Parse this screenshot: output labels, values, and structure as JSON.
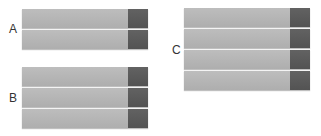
{
  "colors": {
    "light": "#b4b4b4",
    "dark": "#5a5a5a",
    "label": "#333333"
  },
  "groups": [
    {
      "label": "A",
      "bar_count": 2
    },
    {
      "label": "B",
      "bar_count": 3
    },
    {
      "label": "C",
      "bar_count": 4
    }
  ]
}
